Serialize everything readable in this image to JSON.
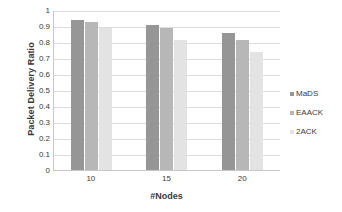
{
  "chart_data": {
    "type": "bar",
    "title": "",
    "subtitle": "",
    "xlabel": "#Nodes",
    "ylabel": "Packet Delivery Ratio",
    "categories": [
      "10",
      "15",
      "20"
    ],
    "series": [
      {
        "name": "MaDS",
        "color": "#969696",
        "values": [
          0.935,
          0.905,
          0.855
        ]
      },
      {
        "name": "EAACK",
        "color": "#b7b7b7",
        "values": [
          0.925,
          0.885,
          0.815
        ]
      },
      {
        "name": "2ACK",
        "color": "#e3e3e3",
        "values": [
          0.89,
          0.81,
          0.735
        ]
      }
    ],
    "ylim": [
      0,
      1
    ],
    "ytick_labels": [
      "1",
      "0.9",
      "0.8",
      "0.7",
      "0.6",
      "0.5",
      "0.4",
      "0.3",
      "0.2",
      "0.1",
      "0"
    ],
    "ytick_values": [
      1,
      0.9,
      0.8,
      0.7,
      0.6,
      0.5,
      0.4,
      0.3,
      0.2,
      0.1,
      0
    ],
    "grid": true,
    "grid_axis": "y",
    "legend_position": "right",
    "legend": [
      "MaDS",
      "EAACK",
      "2ACK"
    ],
    "background_color": "#ffffff",
    "grid_color": "#dcdcdc",
    "axis_color": "#c8c8c8",
    "text_color": "#3a3a3a"
  }
}
